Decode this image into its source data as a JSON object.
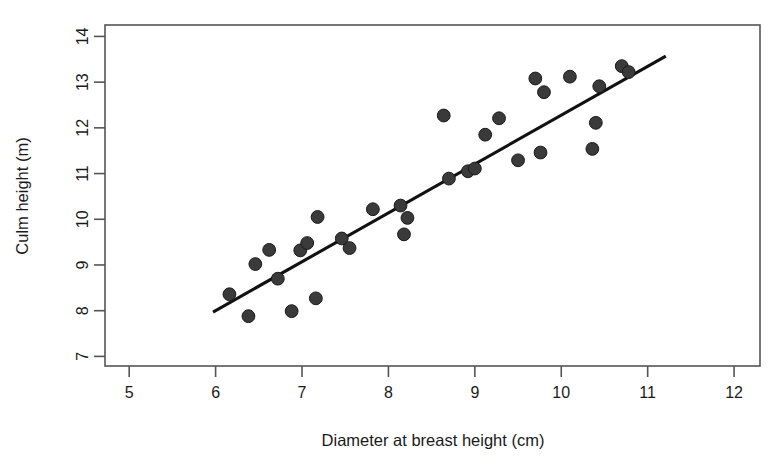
{
  "chart_data": {
    "type": "scatter",
    "title": "",
    "xlabel": "Diameter at breast height (cm)",
    "ylabel": "Culm height (m)",
    "xlim": [
      4.72,
      12.3
    ],
    "ylim": [
      6.79,
      14.25
    ],
    "xticks": [
      5,
      6,
      7,
      8,
      9,
      10,
      11,
      12
    ],
    "xtick_labels": [
      "5",
      "6",
      "7",
      "8",
      "9",
      "10",
      "11",
      "12"
    ],
    "yticks": [
      7,
      8,
      9,
      10,
      11,
      12,
      13,
      14
    ],
    "ytick_labels": [
      "7",
      "8",
      "9",
      "10",
      "11",
      "12",
      "13",
      "14"
    ],
    "grid": false,
    "legend": false,
    "point_color": "#3a3a3a",
    "point_edge_color": "#1a1a1a",
    "line_color": "#111111",
    "frame_color": "#555555",
    "points": [
      {
        "x": 6.16,
        "y": 8.36
      },
      {
        "x": 6.38,
        "y": 7.88
      },
      {
        "x": 6.46,
        "y": 9.02
      },
      {
        "x": 6.62,
        "y": 9.33
      },
      {
        "x": 6.72,
        "y": 8.7
      },
      {
        "x": 6.88,
        "y": 7.99
      },
      {
        "x": 6.98,
        "y": 9.32
      },
      {
        "x": 7.06,
        "y": 9.48
      },
      {
        "x": 7.16,
        "y": 8.27
      },
      {
        "x": 7.18,
        "y": 10.05
      },
      {
        "x": 7.46,
        "y": 9.58
      },
      {
        "x": 7.55,
        "y": 9.37
      },
      {
        "x": 7.82,
        "y": 10.22
      },
      {
        "x": 8.14,
        "y": 10.3
      },
      {
        "x": 8.18,
        "y": 9.67
      },
      {
        "x": 8.22,
        "y": 10.03
      },
      {
        "x": 8.64,
        "y": 12.27
      },
      {
        "x": 8.7,
        "y": 10.89
      },
      {
        "x": 8.92,
        "y": 11.05
      },
      {
        "x": 9.0,
        "y": 11.11
      },
      {
        "x": 9.12,
        "y": 11.85
      },
      {
        "x": 9.28,
        "y": 12.21
      },
      {
        "x": 9.5,
        "y": 11.29
      },
      {
        "x": 9.7,
        "y": 13.08
      },
      {
        "x": 9.76,
        "y": 11.46
      },
      {
        "x": 9.8,
        "y": 12.78
      },
      {
        "x": 10.1,
        "y": 13.12
      },
      {
        "x": 10.36,
        "y": 11.54
      },
      {
        "x": 10.4,
        "y": 12.11
      },
      {
        "x": 10.44,
        "y": 12.91
      },
      {
        "x": 10.7,
        "y": 13.35
      },
      {
        "x": 10.78,
        "y": 13.22
      }
    ],
    "fit_line": {
      "x_start": 5.97,
      "y_start": 7.97,
      "x_end": 11.21,
      "y_end": 13.57
    }
  }
}
